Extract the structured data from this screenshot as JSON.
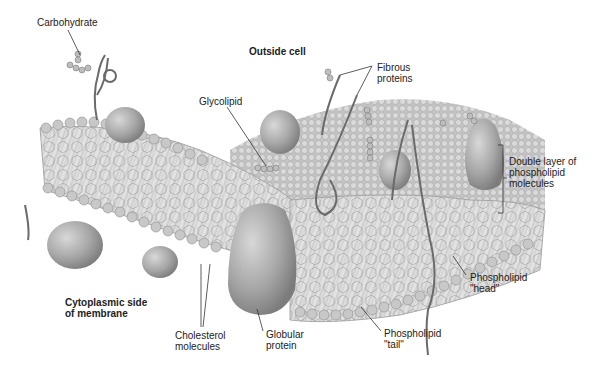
{
  "diagram": {
    "regions": {
      "outside": "Outside cell",
      "inside_line1": "Cytoplasmic side",
      "inside_line2": "of membrane"
    },
    "labels": {
      "carbohydrate": "Carbohydrate",
      "glycolipid": "Glycolipid",
      "fibrous_1": "Fibrous",
      "fibrous_2": "proteins",
      "double_1": "Double layer of",
      "double_2": "phospholipid",
      "double_3": "molecules",
      "head_1": "Phospholipid",
      "head_2": "\"head\"",
      "tail_1": "Phospholipid",
      "tail_2": "\"tail\"",
      "globular_1": "Globular",
      "globular_2": "protein",
      "cholesterol_1": "Cholesterol",
      "cholesterol_2": "molecules"
    },
    "colors": {
      "membrane_light": "#d6d6d6",
      "membrane_mid": "#b5b5b5",
      "membrane_dark": "#8a8a8a",
      "protein": "#a9a9a9",
      "text": "#222222"
    }
  }
}
